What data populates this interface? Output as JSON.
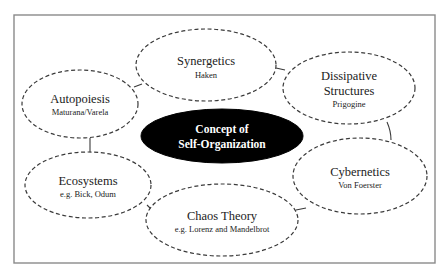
{
  "diagram": {
    "center": {
      "line1": "Concept of",
      "line2": "Self-Organization"
    },
    "nodes": [
      {
        "id": "synergetics",
        "title": "Synergetics",
        "subtitle": "Haken"
      },
      {
        "id": "dissipative-structures",
        "title_line1": "Dissipative",
        "title_line2": "Structures",
        "subtitle": "Prigogine"
      },
      {
        "id": "cybernetics",
        "title": "Cybernetics",
        "subtitle": "Von Foerster"
      },
      {
        "id": "chaos-theory",
        "title": "Chaos Theory",
        "subtitle": "e.g. Lorenz and Mandelbrot"
      },
      {
        "id": "ecosystems",
        "title": "Ecosystems",
        "subtitle": "e.g. Bick, Odum"
      },
      {
        "id": "autopoiesis",
        "title": "Autopoiesis",
        "subtitle": "Maturana/Varela"
      }
    ],
    "colors": {
      "center_fill": "#000000",
      "center_text": "#ffffff",
      "node_stroke": "#3a3a3a",
      "frame_stroke": "#8a8a8a"
    }
  }
}
